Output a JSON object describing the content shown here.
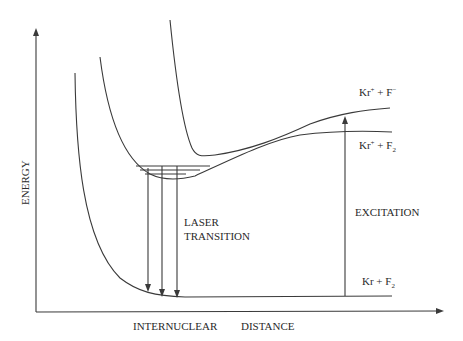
{
  "diagram": {
    "axes": {
      "y_label": "ENERGY",
      "x_label_part1": "INTERNUCLEAR",
      "x_label_part2": "DISTANCE"
    },
    "curves": [
      {
        "id": "ionic",
        "label_base": "Kr",
        "label_sup1": "+",
        "label_mid": " + F",
        "label_sup2": "−"
      },
      {
        "id": "covalent-excited",
        "label_base": "Kr",
        "label_sup1": "+",
        "label_mid": " + F",
        "label_sub2": "2"
      },
      {
        "id": "ground",
        "label_base": "Kr + F",
        "label_sub2": "2"
      }
    ],
    "annotations": {
      "laser_line1": "LASER",
      "laser_line2": "TRANSITION",
      "excitation": "EXCITATION"
    }
  }
}
